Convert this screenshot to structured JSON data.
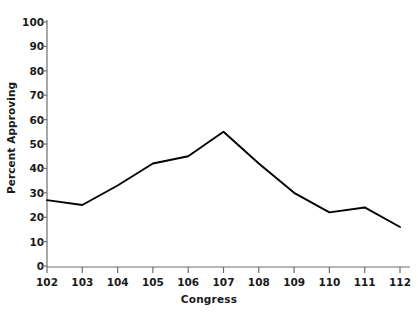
{
  "chart_data": {
    "type": "line",
    "title": "",
    "xlabel": "Congress",
    "ylabel": "Percent Approving",
    "categories": [
      "102",
      "103",
      "104",
      "105",
      "106",
      "107",
      "108",
      "109",
      "110",
      "111",
      "112"
    ],
    "values": [
      27,
      25,
      33,
      42,
      45,
      55,
      42,
      30,
      22,
      24,
      16
    ],
    "series": [
      {
        "name": "Percent Approving",
        "values": [
          27,
          25,
          33,
          42,
          45,
          55,
          42,
          30,
          22,
          24,
          16
        ],
        "color": "#000000"
      }
    ],
    "ylim": [
      0,
      100
    ],
    "ytick_labels": [
      "0",
      "10",
      "20",
      "30",
      "40",
      "50",
      "60",
      "70",
      "80",
      "90",
      "100"
    ],
    "ytick_values": [
      0,
      10,
      20,
      30,
      40,
      50,
      60,
      70,
      80,
      90,
      100
    ],
    "xtick_labels": [
      "102",
      "103",
      "104",
      "105",
      "106",
      "107",
      "108",
      "109",
      "110",
      "111",
      "112"
    ],
    "grid": false,
    "legend": false,
    "legend_position": "none",
    "axis_color": "#6e6e6e",
    "line_color": "#000000",
    "background": "#ffffff"
  }
}
